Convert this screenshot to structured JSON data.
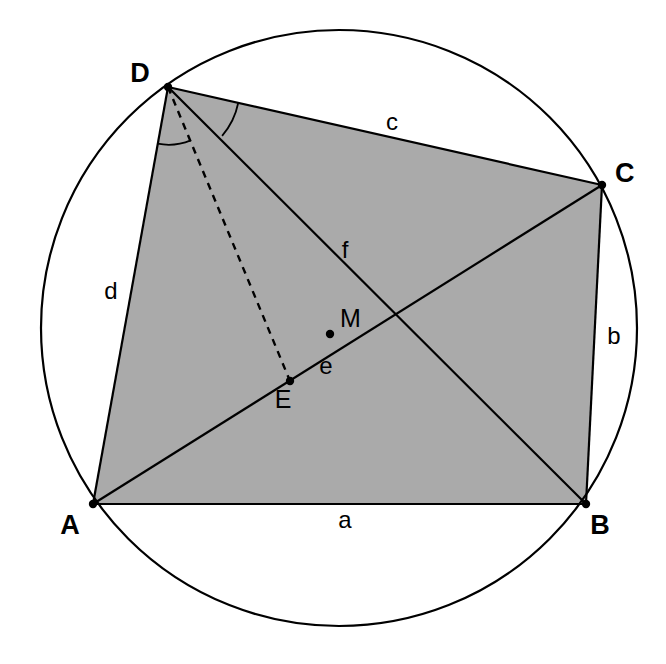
{
  "figure": {
    "canvas": {
      "width": 666,
      "height": 664
    },
    "background_color": "#ffffff",
    "stroke_color": "#000000",
    "fill_color": "#aaaaaa",
    "stroke_width": 2.2
  },
  "circle": {
    "name": "circumcircle",
    "center": {
      "x": 339,
      "y": 328
    },
    "radius": 298,
    "stroke_color": "#000000",
    "fill": "none"
  },
  "vertices": [
    {
      "id": "A",
      "label": "A",
      "x": 93,
      "y": 504,
      "label_x": 70,
      "label_y": 534,
      "dot": true
    },
    {
      "id": "B",
      "label": "B",
      "x": 586,
      "y": 504,
      "label_x": 600,
      "label_y": 534,
      "dot": true
    },
    {
      "id": "C",
      "label": "C",
      "x": 602,
      "y": 185,
      "label_x": 615,
      "label_y": 182,
      "dot": true
    },
    {
      "id": "D",
      "label": "D",
      "x": 168,
      "y": 87,
      "label_x": 140,
      "label_y": 82,
      "dot": true
    }
  ],
  "interior_points": [
    {
      "id": "M",
      "label": "M",
      "x": 330,
      "y": 334,
      "label_x": 340,
      "label_y": 327,
      "dot": true
    },
    {
      "id": "E",
      "label": "E",
      "x": 290,
      "y": 381,
      "label_x": 283,
      "label_y": 408,
      "dot": true
    }
  ],
  "sides": [
    {
      "id": "a",
      "label": "a",
      "from": "A",
      "to": "B",
      "label_x": 345,
      "label_y": 528
    },
    {
      "id": "b",
      "label": "b",
      "from": "B",
      "to": "C",
      "label_x": 614,
      "label_y": 344
    },
    {
      "id": "c",
      "label": "c",
      "from": "C",
      "to": "D",
      "label_x": 392,
      "label_y": 130
    },
    {
      "id": "d",
      "label": "d",
      "from": "D",
      "to": "A",
      "label_x": 111,
      "label_y": 299
    }
  ],
  "diagonals": [
    {
      "id": "e",
      "label": "e",
      "from": "A",
      "to": "C",
      "label_x": 326,
      "label_y": 374
    },
    {
      "id": "f",
      "label": "f",
      "from": "B",
      "to": "D",
      "label_x": 345,
      "label_y": 258
    }
  ],
  "dashed_segments": [
    {
      "id": "DE",
      "from": "D",
      "to": "E",
      "style": "dashed"
    }
  ],
  "angle_arcs": [
    {
      "id": "angle-ade",
      "at": "D",
      "radius": 58,
      "description": "angle between DA and DE"
    },
    {
      "id": "angle-bdc",
      "at": "D",
      "radius": 72,
      "description": "angle between DB and DC"
    }
  ],
  "quadrilateral": {
    "name": "ABCD",
    "order": [
      "A",
      "B",
      "C",
      "D"
    ],
    "fill_color": "#aaaaaa"
  }
}
